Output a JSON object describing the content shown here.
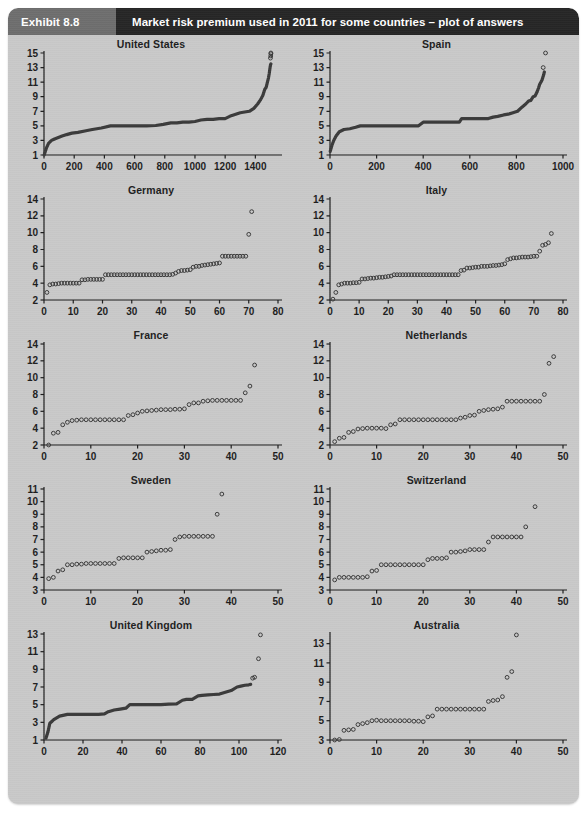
{
  "header": {
    "exhibit_label": "Exhibit 8.8",
    "title": "Market risk premium used in 2011 for some countries – plot of answers"
  },
  "colors": {
    "panel_bg": "#c9c9c9",
    "exhibit_bg": "#6e6e6e",
    "title_bg": "#262626",
    "title_text": "#ffffff",
    "ink": "#1d1d1d",
    "marker": "#3a3a3a",
    "page_bg": "#ffffff"
  },
  "chart_data": [
    {
      "type": "scatter",
      "title": "United States",
      "xlabel": "",
      "ylabel": "",
      "xlim": [
        0,
        1550
      ],
      "ylim": [
        1,
        15
      ],
      "xticks": [
        0,
        200,
        400,
        600,
        800,
        1000,
        1200,
        1400
      ],
      "yticks": [
        1,
        3,
        5,
        7,
        9,
        11,
        13,
        15
      ],
      "grid": false,
      "n_answers": 1503,
      "x": [
        1,
        15,
        30,
        50,
        70,
        95,
        120,
        150,
        185,
        225,
        270,
        320,
        380,
        440,
        500,
        560,
        620,
        680,
        740,
        790,
        840,
        880,
        920,
        960,
        1000,
        1040,
        1080,
        1120,
        1160,
        1200,
        1240,
        1270,
        1300,
        1330,
        1360,
        1390,
        1415,
        1435,
        1450,
        1462,
        1472,
        1480,
        1487,
        1492,
        1496,
        1499,
        1501,
        1503
      ],
      "y": [
        1.0,
        1.9,
        2.6,
        3.0,
        3.2,
        3.4,
        3.6,
        3.8,
        4.0,
        4.1,
        4.3,
        4.5,
        4.7,
        5.0,
        5.0,
        5.0,
        5.0,
        5.0,
        5.05,
        5.2,
        5.4,
        5.4,
        5.5,
        5.5,
        5.6,
        5.8,
        5.9,
        5.9,
        6.0,
        6.0,
        6.4,
        6.6,
        6.8,
        6.9,
        7.0,
        7.4,
        8.0,
        8.6,
        9.2,
        10.0,
        10.3,
        11.0,
        11.6,
        12.2,
        12.8,
        13.2,
        13.4,
        13.5
      ],
      "outliers_x": [
        1500,
        1502,
        1503,
        1503
      ],
      "outliers_y": [
        14.3,
        14.6,
        14.9,
        15.0
      ],
      "style": "thick-line"
    },
    {
      "type": "scatter",
      "title": "Spain",
      "xlabel": "",
      "ylabel": "",
      "xlim": [
        0,
        1000
      ],
      "ylim": [
        1,
        15
      ],
      "xticks": [
        0,
        200,
        400,
        600,
        800,
        1000
      ],
      "yticks": [
        1,
        3,
        5,
        7,
        9,
        11,
        13,
        15
      ],
      "grid": false,
      "n_answers": 930,
      "x": [
        1,
        8,
        16,
        26,
        40,
        60,
        85,
        110,
        130,
        160,
        200,
        250,
        300,
        350,
        380,
        400,
        440,
        480,
        520,
        555,
        565,
        600,
        640,
        680,
        700,
        720,
        745,
        765,
        785,
        805,
        825,
        840,
        852,
        862,
        872,
        880,
        888,
        895,
        900,
        905,
        910,
        914,
        917,
        920
      ],
      "y": [
        1.5,
        2.3,
        3.0,
        3.6,
        4.2,
        4.5,
        4.6,
        4.8,
        5.0,
        5.0,
        5.0,
        5.0,
        5.0,
        5.0,
        5.0,
        5.5,
        5.5,
        5.5,
        5.5,
        5.5,
        6.0,
        6.0,
        6.0,
        6.0,
        6.2,
        6.3,
        6.5,
        6.6,
        6.8,
        7.0,
        7.6,
        8.0,
        8.4,
        8.5,
        9.0,
        9.1,
        9.6,
        10.2,
        10.7,
        11.0,
        11.3,
        11.7,
        12.0,
        12.4
      ],
      "outliers_x": [
        915,
        925
      ],
      "outliers_y": [
        13.0,
        15.0
      ],
      "style": "thick-line"
    },
    {
      "type": "scatter",
      "title": "Germany",
      "xlabel": "",
      "ylabel": "",
      "xlim": [
        0,
        80
      ],
      "ylim": [
        2,
        14
      ],
      "xticks": [
        0,
        10,
        20,
        30,
        40,
        50,
        60,
        70,
        80
      ],
      "yticks": [
        2,
        4,
        6,
        8,
        10,
        12,
        14
      ],
      "grid": false,
      "n_answers": 72,
      "x": [
        1,
        2,
        3,
        4,
        5,
        6,
        7,
        8,
        9,
        10,
        11,
        12,
        13,
        14,
        15,
        16,
        17,
        18,
        19,
        20,
        21,
        22,
        23,
        24,
        25,
        26,
        27,
        28,
        29,
        30,
        31,
        32,
        33,
        34,
        35,
        36,
        37,
        38,
        39,
        40,
        41,
        42,
        43,
        44,
        45,
        46,
        47,
        48,
        49,
        50,
        51,
        52,
        53,
        54,
        55,
        56,
        57,
        58,
        59,
        60,
        61,
        62,
        63,
        64,
        65,
        66,
        67,
        68,
        69
      ],
      "y": [
        2.9,
        3.8,
        3.9,
        3.9,
        3.95,
        4.0,
        4.0,
        4.0,
        4.0,
        4.0,
        4.0,
        4.0,
        4.4,
        4.4,
        4.45,
        4.45,
        4.45,
        4.45,
        4.45,
        4.45,
        5.0,
        5.0,
        5.0,
        5.0,
        5.0,
        5.0,
        5.0,
        5.0,
        5.0,
        5.0,
        5.0,
        5.0,
        5.0,
        5.0,
        5.0,
        5.0,
        5.0,
        5.0,
        5.0,
        5.0,
        5.0,
        5.0,
        5.0,
        5.05,
        5.2,
        5.4,
        5.5,
        5.5,
        5.55,
        5.6,
        5.9,
        6.0,
        6.0,
        6.1,
        6.15,
        6.2,
        6.25,
        6.3,
        6.35,
        6.4,
        7.2,
        7.2,
        7.2,
        7.2,
        7.2,
        7.2,
        7.2,
        7.2,
        7.2
      ],
      "outliers_x": [
        70,
        71
      ],
      "outliers_y": [
        9.8,
        12.5
      ],
      "style": "markers"
    },
    {
      "type": "scatter",
      "title": "Italy",
      "xlabel": "",
      "ylabel": "",
      "xlim": [
        0,
        80
      ],
      "ylim": [
        2,
        14
      ],
      "xticks": [
        0,
        10,
        20,
        30,
        40,
        50,
        60,
        70,
        80
      ],
      "yticks": [
        2,
        4,
        6,
        8,
        10,
        12,
        14
      ],
      "grid": false,
      "n_answers": 76,
      "x": [
        1,
        2,
        3,
        4,
        5,
        6,
        7,
        8,
        9,
        10,
        11,
        12,
        13,
        14,
        15,
        16,
        17,
        18,
        19,
        20,
        21,
        22,
        23,
        24,
        25,
        26,
        27,
        28,
        29,
        30,
        31,
        32,
        33,
        34,
        35,
        36,
        37,
        38,
        39,
        40,
        41,
        42,
        43,
        44,
        45,
        46,
        47,
        48,
        49,
        50,
        51,
        52,
        53,
        54,
        55,
        56,
        57,
        58,
        59,
        60,
        61,
        62,
        63,
        64,
        65,
        66,
        67,
        68,
        69,
        70,
        71,
        72,
        73,
        74,
        75,
        76
      ],
      "y": [
        2.1,
        2.9,
        3.8,
        3.9,
        4.0,
        4.0,
        4.0,
        4.05,
        4.05,
        4.1,
        4.5,
        4.5,
        4.55,
        4.6,
        4.6,
        4.65,
        4.7,
        4.7,
        4.75,
        4.8,
        4.85,
        5.0,
        5.0,
        5.0,
        5.0,
        5.0,
        5.0,
        5.0,
        5.0,
        5.0,
        5.0,
        5.0,
        5.0,
        5.0,
        5.0,
        5.0,
        5.0,
        5.0,
        5.0,
        5.0,
        5.0,
        5.0,
        5.0,
        5.0,
        5.5,
        5.55,
        5.8,
        5.8,
        5.85,
        5.9,
        5.9,
        6.0,
        6.0,
        6.0,
        6.05,
        6.1,
        6.1,
        6.15,
        6.2,
        6.3,
        6.8,
        6.9,
        7.0,
        7.0,
        7.05,
        7.1,
        7.1,
        7.1,
        7.15,
        7.2,
        7.2,
        7.8,
        8.5,
        8.6,
        8.8,
        9.9
      ],
      "outliers_x": [],
      "outliers_y": [],
      "style": "markers"
    },
    {
      "type": "scatter",
      "title": "France",
      "xlabel": "",
      "ylabel": "",
      "xlim": [
        0,
        50
      ],
      "ylim": [
        2,
        14
      ],
      "xticks": [
        0,
        10,
        20,
        30,
        40,
        50
      ],
      "yticks": [
        2,
        4,
        6,
        8,
        10,
        12,
        14
      ],
      "grid": false,
      "n_answers": 45,
      "x": [
        1,
        2,
        3,
        4,
        5,
        6,
        7,
        8,
        9,
        10,
        11,
        12,
        13,
        14,
        15,
        16,
        17,
        18,
        19,
        20,
        21,
        22,
        23,
        24,
        25,
        26,
        27,
        28,
        29,
        30,
        31,
        32,
        33,
        34,
        35,
        36,
        37,
        38,
        39,
        40,
        41,
        42
      ],
      "y": [
        2.0,
        3.4,
        3.5,
        4.4,
        4.7,
        4.9,
        4.95,
        5.0,
        5.0,
        5.0,
        5.0,
        5.0,
        5.0,
        5.0,
        5.0,
        5.0,
        5.0,
        5.5,
        5.6,
        5.8,
        6.0,
        6.05,
        6.1,
        6.15,
        6.2,
        6.2,
        6.2,
        6.25,
        6.25,
        6.3,
        6.8,
        7.0,
        7.0,
        7.2,
        7.25,
        7.3,
        7.3,
        7.3,
        7.3,
        7.3,
        7.3,
        7.3
      ],
      "outliers_x": [
        43,
        44,
        45
      ],
      "outliers_y": [
        8.2,
        9.0,
        11.5
      ],
      "style": "markers"
    },
    {
      "type": "scatter",
      "title": "Netherlands",
      "xlabel": "",
      "ylabel": "",
      "xlim": [
        0,
        50
      ],
      "ylim": [
        2,
        14
      ],
      "xticks": [
        0,
        10,
        20,
        30,
        40,
        50
      ],
      "yticks": [
        2,
        4,
        6,
        8,
        10,
        12,
        14
      ],
      "grid": false,
      "n_answers": 48,
      "x": [
        1,
        2,
        3,
        4,
        5,
        6,
        7,
        8,
        9,
        10,
        11,
        12,
        13,
        14,
        15,
        16,
        17,
        18,
        19,
        20,
        21,
        22,
        23,
        24,
        25,
        26,
        27,
        28,
        29,
        30,
        31,
        32,
        33,
        34,
        35,
        36,
        37,
        38,
        39,
        40,
        41,
        42,
        43,
        44,
        45
      ],
      "y": [
        2.4,
        2.8,
        2.9,
        3.5,
        3.6,
        3.9,
        3.95,
        4.0,
        4.0,
        4.0,
        4.0,
        3.95,
        4.4,
        4.5,
        5.0,
        5.0,
        5.0,
        5.0,
        5.0,
        5.0,
        5.0,
        5.0,
        5.0,
        5.0,
        5.0,
        5.0,
        5.0,
        5.2,
        5.3,
        5.5,
        5.55,
        6.0,
        6.1,
        6.2,
        6.25,
        6.3,
        6.5,
        7.2,
        7.2,
        7.2,
        7.2,
        7.2,
        7.2,
        7.2,
        7.2
      ],
      "outliers_x": [
        46,
        47,
        48
      ],
      "outliers_y": [
        8.0,
        11.7,
        12.5
      ],
      "style": "markers"
    },
    {
      "type": "scatter",
      "title": "Sweden",
      "xlabel": "",
      "ylabel": "",
      "xlim": [
        0,
        50
      ],
      "ylim": [
        3,
        11
      ],
      "xticks": [
        0,
        10,
        20,
        30,
        40,
        50
      ],
      "yticks": [
        3,
        4,
        5,
        6,
        7,
        8,
        9,
        10,
        11
      ],
      "grid": false,
      "n_answers": 38,
      "x": [
        1,
        2,
        3,
        4,
        5,
        6,
        7,
        8,
        9,
        10,
        11,
        12,
        13,
        14,
        15,
        16,
        17,
        18,
        19,
        20,
        21,
        22,
        23,
        24,
        25,
        26,
        27,
        28,
        29,
        30,
        31,
        32,
        33,
        34,
        35,
        36
      ],
      "y": [
        3.9,
        4.0,
        4.5,
        4.6,
        5.0,
        5.0,
        5.05,
        5.05,
        5.1,
        5.1,
        5.1,
        5.1,
        5.1,
        5.1,
        5.1,
        5.5,
        5.55,
        5.55,
        5.55,
        5.55,
        5.55,
        6.0,
        6.05,
        6.1,
        6.15,
        6.15,
        6.2,
        7.0,
        7.2,
        7.25,
        7.25,
        7.25,
        7.25,
        7.25,
        7.25,
        7.25
      ],
      "outliers_x": [
        37,
        38
      ],
      "outliers_y": [
        9.0,
        10.6
      ],
      "style": "markers"
    },
    {
      "type": "scatter",
      "title": "Switzerland",
      "xlabel": "",
      "ylabel": "",
      "xlim": [
        0,
        50
      ],
      "ylim": [
        3,
        11
      ],
      "xticks": [
        0,
        10,
        20,
        30,
        40,
        50
      ],
      "yticks": [
        3,
        4,
        5,
        6,
        7,
        8,
        9,
        10,
        11
      ],
      "grid": false,
      "n_answers": 44,
      "x": [
        1,
        2,
        3,
        4,
        5,
        6,
        7,
        8,
        9,
        10,
        11,
        12,
        13,
        14,
        15,
        16,
        17,
        18,
        19,
        20,
        21,
        22,
        23,
        24,
        25,
        26,
        27,
        28,
        29,
        30,
        31,
        32,
        33,
        34,
        35,
        36,
        37,
        38,
        39,
        40,
        41
      ],
      "y": [
        3.8,
        4.0,
        4.0,
        4.0,
        4.0,
        4.0,
        4.0,
        4.05,
        4.5,
        4.55,
        5.0,
        5.0,
        5.0,
        5.0,
        5.0,
        5.0,
        5.0,
        5.0,
        5.0,
        5.0,
        5.4,
        5.5,
        5.5,
        5.5,
        5.55,
        6.0,
        6.0,
        6.05,
        6.1,
        6.2,
        6.2,
        6.2,
        6.2,
        6.8,
        7.2,
        7.2,
        7.2,
        7.2,
        7.2,
        7.2,
        7.2
      ],
      "outliers_x": [
        42,
        44
      ],
      "outliers_y": [
        8.0,
        9.6
      ],
      "style": "markers"
    },
    {
      "type": "scatter",
      "title": "United Kingdom",
      "xlabel": "",
      "ylabel": "",
      "xlim": [
        0,
        120
      ],
      "ylim": [
        1,
        13
      ],
      "xticks": [
        0,
        20,
        40,
        60,
        80,
        100,
        120
      ],
      "yticks": [
        1,
        3,
        5,
        7,
        9,
        11,
        13
      ],
      "grid": false,
      "n_answers": 110,
      "x": [
        1,
        2,
        3,
        4,
        5,
        8,
        12,
        16,
        20,
        24,
        28,
        31,
        33,
        36,
        39,
        42,
        44,
        48,
        52,
        56,
        60,
        64,
        68,
        71,
        73,
        76,
        79,
        81,
        84,
        87,
        90,
        93,
        96,
        99,
        101,
        103,
        105,
        106
      ],
      "y": [
        1.2,
        1.9,
        2.9,
        3.1,
        3.3,
        3.7,
        3.9,
        3.9,
        3.9,
        3.9,
        3.9,
        3.95,
        4.2,
        4.4,
        4.5,
        4.6,
        5.0,
        5.0,
        5.0,
        5.0,
        5.0,
        5.05,
        5.1,
        5.5,
        5.6,
        5.6,
        6.0,
        6.05,
        6.1,
        6.15,
        6.2,
        6.4,
        6.6,
        7.0,
        7.1,
        7.2,
        7.25,
        7.3
      ],
      "outliers_x": [
        107,
        108,
        110,
        111
      ],
      "outliers_y": [
        8.0,
        8.1,
        10.2,
        12.9
      ],
      "style": "thick-line"
    },
    {
      "type": "scatter",
      "title": "Australia",
      "xlabel": "",
      "ylabel": "",
      "xlim": [
        0,
        50
      ],
      "ylim": [
        3,
        14
      ],
      "xticks": [
        0,
        10,
        20,
        30,
        40,
        50
      ],
      "yticks": [
        3,
        5,
        7,
        9,
        11,
        13
      ],
      "grid": false,
      "n_answers": 40,
      "x": [
        1,
        2,
        3,
        4,
        5,
        6,
        7,
        8,
        9,
        10,
        11,
        12,
        13,
        14,
        15,
        16,
        17,
        18,
        19,
        20,
        21,
        22,
        23,
        24,
        25,
        26,
        27,
        28,
        29,
        30,
        31,
        32,
        33,
        34,
        35,
        36,
        37
      ],
      "y": [
        3.0,
        3.05,
        4.0,
        4.05,
        4.1,
        4.6,
        4.7,
        4.8,
        5.0,
        5.05,
        5.0,
        5.0,
        5.0,
        5.0,
        5.0,
        5.0,
        5.0,
        4.95,
        4.95,
        4.9,
        5.4,
        5.5,
        6.2,
        6.2,
        6.2,
        6.2,
        6.2,
        6.2,
        6.2,
        6.2,
        6.2,
        6.2,
        6.2,
        7.0,
        7.1,
        7.15,
        7.5
      ],
      "outliers_x": [
        38,
        39,
        40
      ],
      "outliers_y": [
        9.5,
        10.1,
        13.9
      ],
      "style": "markers"
    }
  ]
}
